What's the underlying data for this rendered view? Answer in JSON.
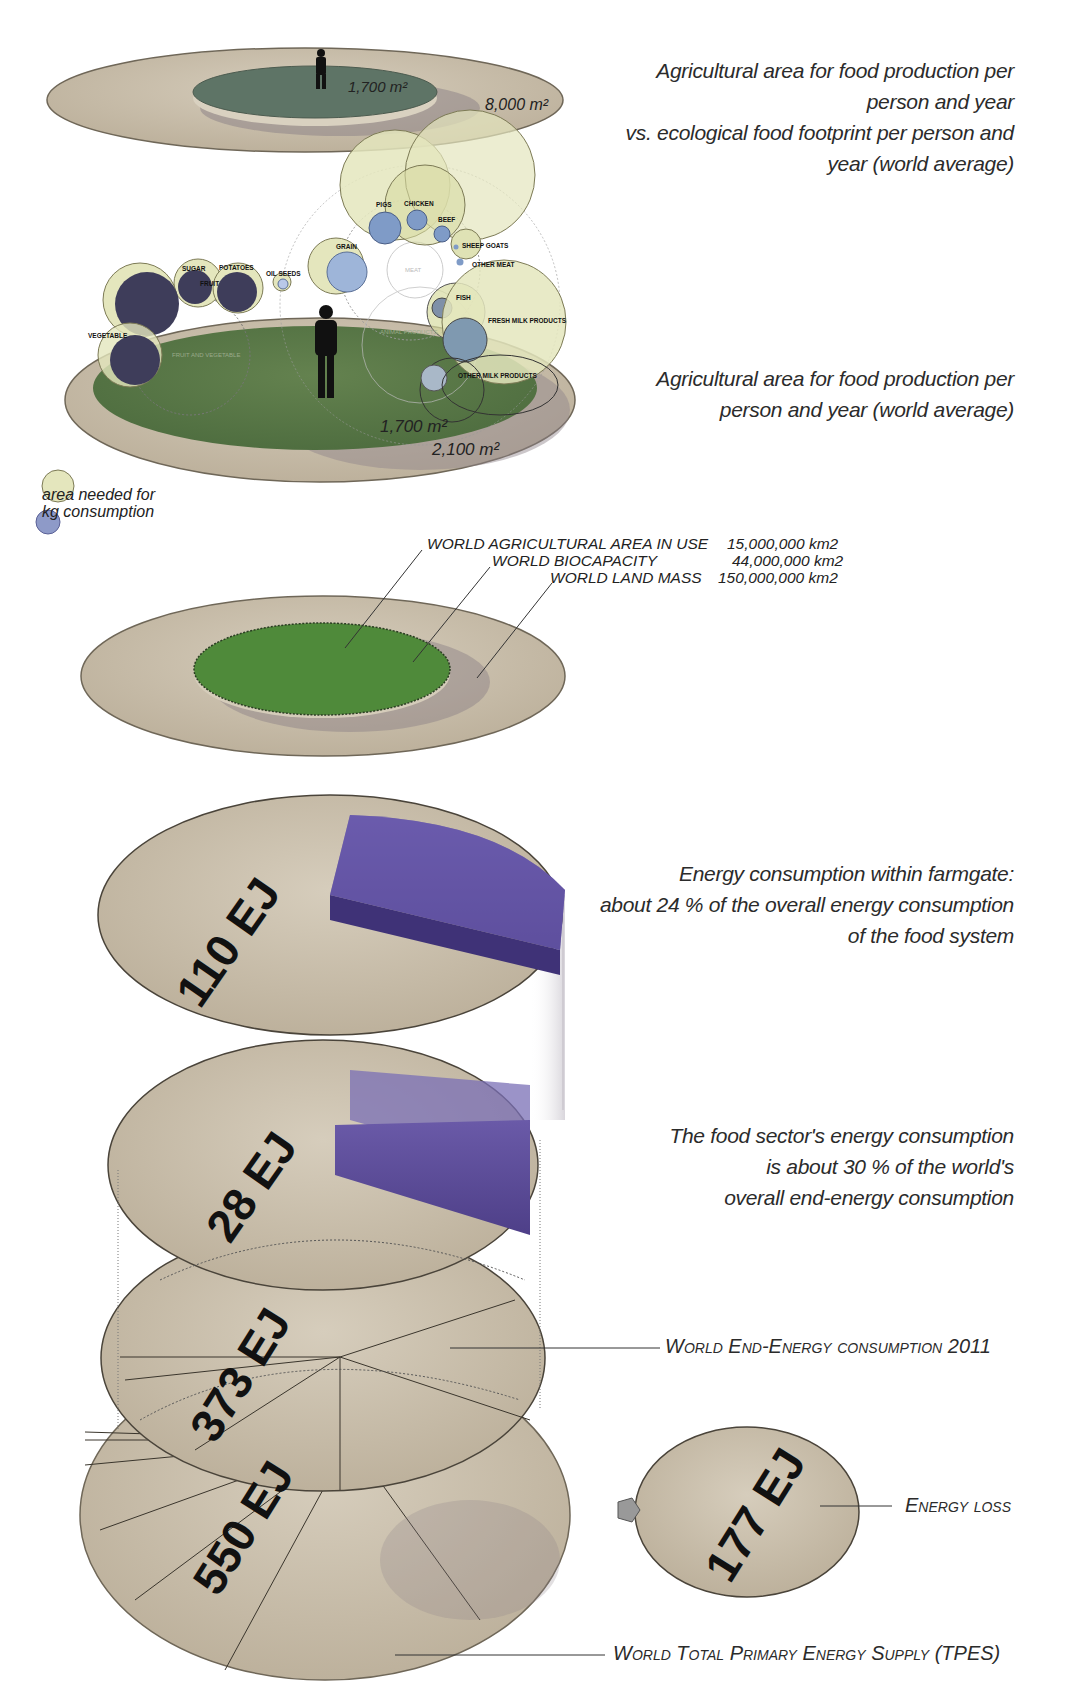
{
  "section1": {
    "top_caption": [
      "Agricultural area for food production per",
      "person and year",
      "vs. ecological food footprint per person and",
      "year (world average)"
    ],
    "top_inner_area": "1,700 m²",
    "top_outer_area": "8,000 m²",
    "bottom_caption": [
      "Agricultural area for food production per",
      "person and year (world average)"
    ],
    "bottom_inner_area": "1,700 m²",
    "bottom_outer_area": "2,100 m²",
    "bubbles": {
      "pigs": "PIGS",
      "chicken": "CHICKEN",
      "beef": "BEEF",
      "sheep_goats": "SHEEP GOATS",
      "other_meat": "OTHER MEAT",
      "meat": "MEAT",
      "grain": "GRAIN",
      "sugar": "SUGAR",
      "potatoes": "POTATOES",
      "fruit": "FRUIT",
      "oil_seeds": "OIL SEEDS",
      "vegetable": "VEGETABLE",
      "fruit_and_vegetable": "FRUIT AND VEGETABLE",
      "animal_products": "ANIMAL PRODUCTS",
      "fish": "FISH",
      "fresh_milk_products": "FRESH MILK PRODUCTS",
      "other_milk_products": "OTHER MILK PRODUCTS"
    },
    "legend": [
      "area needed for",
      "kg consumption"
    ]
  },
  "section2": {
    "rows": [
      {
        "label": "WORLD AGRICULTURAL AREA IN USE",
        "value": "15,000,000 km2"
      },
      {
        "label": "WORLD BIOCAPACITY",
        "value": "44,000,000 km2"
      },
      {
        "label": "WORLD LAND MASS",
        "value": "150,000,000 km2"
      }
    ]
  },
  "section3": {
    "farmgate_caption": [
      "Energy consumption within farmgate:",
      "about 24 % of the overall energy consumption",
      "of the food system"
    ],
    "food_sector_caption": [
      "The food sector's energy consumption",
      "is about 30 % of the world's",
      "overall end-energy consumption"
    ],
    "end_energy_label": "World End-Energy consumption 2011",
    "energy_loss_label": "Energy loss",
    "tpes_label": "World Total Primary Energy Supply (TPES)",
    "disc_values": {
      "farmgate": "110 EJ",
      "food_sector": "28 EJ",
      "end_energy": "373 EJ",
      "tpes": "550 EJ",
      "loss": "177 EJ"
    }
  },
  "colors": {
    "disc_beige": "#c8beac",
    "disc_green": "#5a7a48",
    "bright_green": "#4f8a3a",
    "bubble_pale": "#e4e6bd",
    "bubble_navy": "#3e3d5a",
    "bubble_blue": "#8ea4c8",
    "purple": "#5c4d96"
  }
}
